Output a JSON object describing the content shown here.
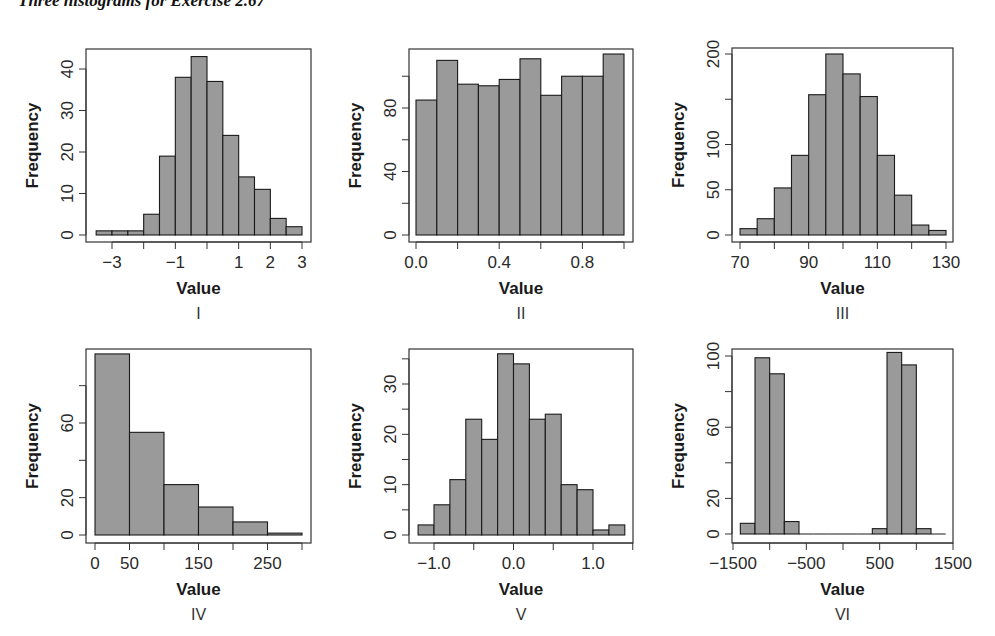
{
  "page": {
    "title": "Three histograms for Exercise 2.67"
  },
  "style": {
    "bar_fill": "#9a9a9a",
    "bar_stroke": "#1a1a1a",
    "axis_color": "#333333"
  },
  "chart_data": [
    {
      "type": "bar",
      "panel_label": "I",
      "title": "",
      "xlabel": "Value",
      "ylabel": "Frequency",
      "bin_edges": [
        -3.5,
        -3.0,
        -2.5,
        -2.0,
        -1.5,
        -1.0,
        -0.5,
        0.0,
        0.5,
        1.0,
        1.5,
        2.0,
        2.5,
        3.0
      ],
      "values": [
        1,
        1,
        1,
        5,
        19,
        38,
        43,
        37,
        24,
        14,
        11,
        4,
        2
      ],
      "x_ticks": [
        -3,
        -2,
        -1,
        0,
        1,
        2,
        3
      ],
      "x_tick_labels": [
        "−3",
        "",
        "−1",
        "",
        "1",
        "2",
        "3"
      ],
      "y_ticks": [
        0,
        10,
        20,
        30,
        40
      ],
      "y_tick_labels": [
        "0",
        "10",
        "20",
        "30",
        "40"
      ],
      "xlim": [
        -3.5,
        3.0
      ],
      "ylim": [
        0,
        43
      ],
      "grid": false
    },
    {
      "type": "bar",
      "panel_label": "II",
      "title": "",
      "xlabel": "Value",
      "ylabel": "Frequency",
      "bin_edges": [
        0.0,
        0.1,
        0.2,
        0.3,
        0.4,
        0.5,
        0.6,
        0.7,
        0.8,
        0.9,
        1.0
      ],
      "values": [
        85,
        110,
        95,
        94,
        98,
        111,
        88,
        100,
        100,
        114
      ],
      "x_ticks": [
        0.0,
        0.2,
        0.4,
        0.6,
        0.8,
        1.0
      ],
      "x_tick_labels": [
        "0.0",
        "",
        "0.4",
        "",
        "0.8",
        ""
      ],
      "y_ticks": [
        0,
        20,
        40,
        60,
        80,
        100
      ],
      "y_tick_labels": [
        "0",
        "",
        "40",
        "",
        "80",
        ""
      ],
      "xlim": [
        0.0,
        1.0
      ],
      "ylim": [
        0,
        114
      ],
      "grid": false
    },
    {
      "type": "bar",
      "panel_label": "III",
      "title": "",
      "xlabel": "Value",
      "ylabel": "Frequency",
      "bin_edges": [
        70,
        75,
        80,
        85,
        90,
        95,
        100,
        105,
        110,
        115,
        120,
        125,
        130
      ],
      "values": [
        7,
        18,
        52,
        88,
        155,
        200,
        178,
        153,
        88,
        44,
        11,
        5
      ],
      "x_ticks": [
        70,
        80,
        90,
        100,
        110,
        120,
        130
      ],
      "x_tick_labels": [
        "70",
        "",
        "90",
        "",
        "110",
        "",
        "130"
      ],
      "y_ticks": [
        0,
        50,
        100,
        150,
        200
      ],
      "y_tick_labels": [
        "0",
        "50",
        "100",
        "",
        "200"
      ],
      "xlim": [
        70,
        130
      ],
      "ylim": [
        0,
        200
      ],
      "grid": false
    },
    {
      "type": "bar",
      "panel_label": "IV",
      "title": "",
      "xlabel": "Value",
      "ylabel": "Frequency",
      "bin_edges": [
        0,
        50,
        100,
        150,
        200,
        250,
        300
      ],
      "values": [
        97,
        55,
        27,
        15,
        7,
        1
      ],
      "x_ticks": [
        0,
        50,
        100,
        150,
        200,
        250,
        300
      ],
      "x_tick_labels": [
        "0",
        "50",
        "",
        "150",
        "",
        "250",
        ""
      ],
      "y_ticks": [
        0,
        20,
        40,
        60,
        80
      ],
      "y_tick_labels": [
        "0",
        "20",
        "",
        "60",
        ""
      ],
      "xlim": [
        0,
        300
      ],
      "ylim": [
        0,
        97
      ],
      "grid": false
    },
    {
      "type": "bar",
      "panel_label": "V",
      "title": "",
      "xlabel": "Value",
      "ylabel": "Frequency",
      "bin_edges": [
        -1.2,
        -1.0,
        -0.8,
        -0.6,
        -0.4,
        -0.2,
        0.0,
        0.2,
        0.4,
        0.6,
        0.8,
        1.0,
        1.2,
        1.4
      ],
      "values": [
        2,
        6,
        11,
        23,
        19,
        36,
        34,
        23,
        24,
        10,
        9,
        1,
        2
      ],
      "x_ticks": [
        -1.0,
        -0.5,
        0.0,
        0.5,
        1.0,
        1.5
      ],
      "x_tick_labels": [
        "−1.0",
        "",
        "0.0",
        "",
        "1.0",
        ""
      ],
      "y_ticks": [
        0,
        5,
        10,
        15,
        20,
        25,
        30,
        35
      ],
      "y_tick_labels": [
        "0",
        "",
        "10",
        "",
        "20",
        "",
        "30",
        ""
      ],
      "xlim": [
        -1.2,
        1.4
      ],
      "ylim": [
        0,
        36
      ],
      "grid": false
    },
    {
      "type": "bar",
      "panel_label": "VI",
      "title": "",
      "xlabel": "Value",
      "ylabel": "Frequency",
      "bin_edges": [
        -1400,
        -1200,
        -1000,
        -800,
        -600,
        -400,
        -200,
        0,
        200,
        400,
        600,
        800,
        1000,
        1200,
        1400
      ],
      "values": [
        6,
        99,
        90,
        7,
        0,
        0,
        0,
        0,
        0,
        3,
        102,
        95,
        3,
        0
      ],
      "x_ticks": [
        -1500,
        -1000,
        -500,
        0,
        500,
        1000,
        1500
      ],
      "x_tick_labels": [
        "−1500",
        "",
        "−500",
        "",
        "500",
        "",
        "1500"
      ],
      "y_ticks": [
        0,
        20,
        40,
        60,
        80,
        100
      ],
      "y_tick_labels": [
        "0",
        "20",
        "",
        "60",
        "",
        "100"
      ],
      "xlim": [
        -1500,
        1500
      ],
      "ylim": [
        0,
        102
      ],
      "grid": false
    }
  ]
}
